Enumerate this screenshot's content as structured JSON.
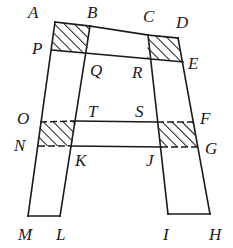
{
  "diagram": {
    "stroke_color": "#1a1a1a",
    "fill_color": "#ffffff",
    "hatch_color": "#1a1a1a",
    "labels": {
      "A": "A",
      "B": "B",
      "C": "C",
      "D": "D",
      "E": "E",
      "F": "F",
      "G": "G",
      "H": "H",
      "I": "I",
      "J": "J",
      "K": "K",
      "L": "L",
      "M": "M",
      "N": "N",
      "O": "O",
      "P": "P",
      "Q": "Q",
      "R": "R",
      "S": "S",
      "T": "T"
    },
    "points": {
      "A": [
        55,
        22
      ],
      "B": [
        90,
        26
      ],
      "C": [
        148,
        35
      ],
      "D": [
        178,
        38
      ],
      "E": [
        183,
        62
      ],
      "P": [
        52,
        50
      ],
      "Q": [
        87,
        53
      ],
      "R": [
        147,
        58
      ],
      "O": [
        40,
        122
      ],
      "T": [
        76,
        121
      ],
      "S": [
        157,
        122
      ],
      "F": [
        194,
        122
      ],
      "N": [
        38,
        146
      ],
      "K": [
        70,
        146
      ],
      "J": [
        161,
        147
      ],
      "G": [
        198,
        147
      ],
      "M": [
        28,
        216
      ],
      "L": [
        60,
        216
      ],
      "I": [
        168,
        214
      ],
      "H": [
        210,
        214
      ]
    },
    "shaded_regions": [
      "ABQP",
      "CDER",
      "OTKN",
      "SFGJ"
    ],
    "dashed_edges": [
      "OT",
      "NK",
      "SF",
      "JG"
    ]
  }
}
